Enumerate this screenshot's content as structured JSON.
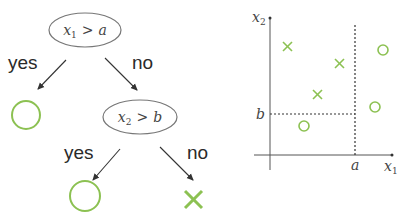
{
  "tree": {
    "root": {
      "var": "x",
      "sub": "1",
      "op": ">",
      "thr": "a"
    },
    "root_yes_label": "yes",
    "root_no_label": "no",
    "child": {
      "var": "x",
      "sub": "2",
      "op": ">",
      "thr": "b"
    },
    "child_yes_label": "yes",
    "child_no_label": "no",
    "leaf_root_yes": "circle",
    "leaf_child_yes": "circle",
    "leaf_child_no": "cross"
  },
  "plot": {
    "x_axis": {
      "var": "x",
      "sub": "1"
    },
    "y_axis": {
      "var": "x",
      "sub": "2"
    },
    "threshold_x_label": "a",
    "threshold_y_label": "b",
    "points": [
      {
        "shape": "cross",
        "x": 0.12,
        "y": 0.8
      },
      {
        "shape": "cross",
        "x": 0.54,
        "y": 0.67
      },
      {
        "shape": "cross",
        "x": 0.36,
        "y": 0.43
      },
      {
        "shape": "circle",
        "x": 0.92,
        "y": 0.77
      },
      {
        "shape": "circle",
        "x": 0.86,
        "y": 0.34
      },
      {
        "shape": "circle",
        "x": 0.27,
        "y": 0.21
      }
    ]
  },
  "colors": {
    "green": "#8cc152",
    "line": "#444444",
    "ellipse": "#666666"
  }
}
